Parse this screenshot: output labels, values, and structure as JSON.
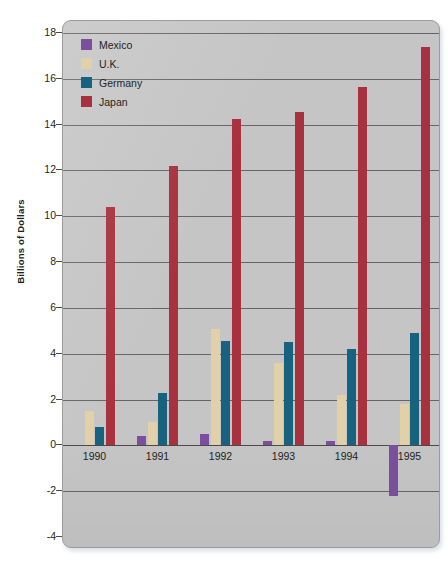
{
  "chart_data": {
    "type": "bar",
    "title": "",
    "xlabel": "",
    "ylabel": "Billions of Dollars",
    "categories": [
      "1990",
      "1991",
      "1992",
      "1993",
      "1994",
      "1995"
    ],
    "series": [
      {
        "name": "Mexico",
        "color": "#7b4f9d",
        "values": [
          0.0,
          0.4,
          0.5,
          0.2,
          0.2,
          -2.2
        ]
      },
      {
        "name": "U.K.",
        "color": "#e2d0a9",
        "values": [
          1.5,
          1.0,
          5.1,
          3.6,
          2.2,
          1.8
        ]
      },
      {
        "name": "Germany",
        "color": "#17627f",
        "values": [
          0.8,
          2.3,
          4.55,
          4.5,
          4.2,
          4.9
        ]
      },
      {
        "name": "Japan",
        "color": "#a8313f",
        "values": [
          10.4,
          12.2,
          14.25,
          14.55,
          15.65,
          17.4
        ]
      }
    ],
    "ylim": [
      -4,
      18
    ],
    "ytick_step": 2,
    "yticks": [
      18,
      16,
      14,
      12,
      10,
      8,
      6,
      4,
      2,
      0,
      -2,
      -4
    ],
    "ytick_labels": [
      "18",
      "16",
      "14",
      "12",
      "10",
      "8",
      "6",
      "4",
      "2",
      "0",
      "-2",
      "-4"
    ],
    "grid": true,
    "grid_axis": "y",
    "legend_position": "top-left",
    "plot_background": "#c5c5c5",
    "gridline_color": "#4c4c4c",
    "text_color": "#231f20"
  },
  "legend": {
    "entries": [
      {
        "label": "Mexico",
        "color": "#7b4f9d"
      },
      {
        "label": "U.K.",
        "color": "#e2d0a9"
      },
      {
        "label": "Germany",
        "color": "#17627f"
      },
      {
        "label": "Japan",
        "color": "#a8313f"
      }
    ]
  },
  "axis": {
    "y_title": "Billions of Dollars"
  }
}
